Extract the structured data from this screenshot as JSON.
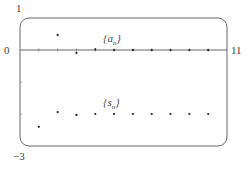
{
  "chart_data": {
    "type": "scatter",
    "title": "",
    "xlabel": "",
    "ylabel": "",
    "xlim": [
      0,
      11
    ],
    "ylim": [
      -3,
      1
    ],
    "grid": false,
    "legend_position": "inline labels",
    "tick_labels": {
      "x_left": "0",
      "x_right": "11",
      "y_top": "1",
      "y_bottom": "-3"
    },
    "y_minor_ticks": [
      -1,
      -2
    ],
    "series": [
      {
        "name": "{a_n}",
        "label_base": "{a",
        "label_sub": "n",
        "label_close": "}",
        "x": [
          2,
          3,
          4,
          5,
          6,
          7,
          8,
          9,
          10
        ],
        "values": [
          0.47,
          -0.09,
          0.02,
          0.0,
          0.0,
          0.0,
          0.0,
          0.0,
          0.0
        ]
      },
      {
        "name": "{s_n}",
        "label_base": "{s",
        "label_sub": "n",
        "label_close": "}",
        "x": [
          1,
          2,
          3,
          4,
          5,
          6,
          7,
          8,
          9,
          10
        ],
        "values": [
          -2.4,
          -1.94,
          -2.03,
          -2.0,
          -2.0,
          -2.0,
          -2.0,
          -2.0,
          -2.0,
          -2.0
        ]
      }
    ]
  },
  "colors": {
    "axis": "#666666",
    "points": "#222222",
    "frame": "#666666"
  }
}
